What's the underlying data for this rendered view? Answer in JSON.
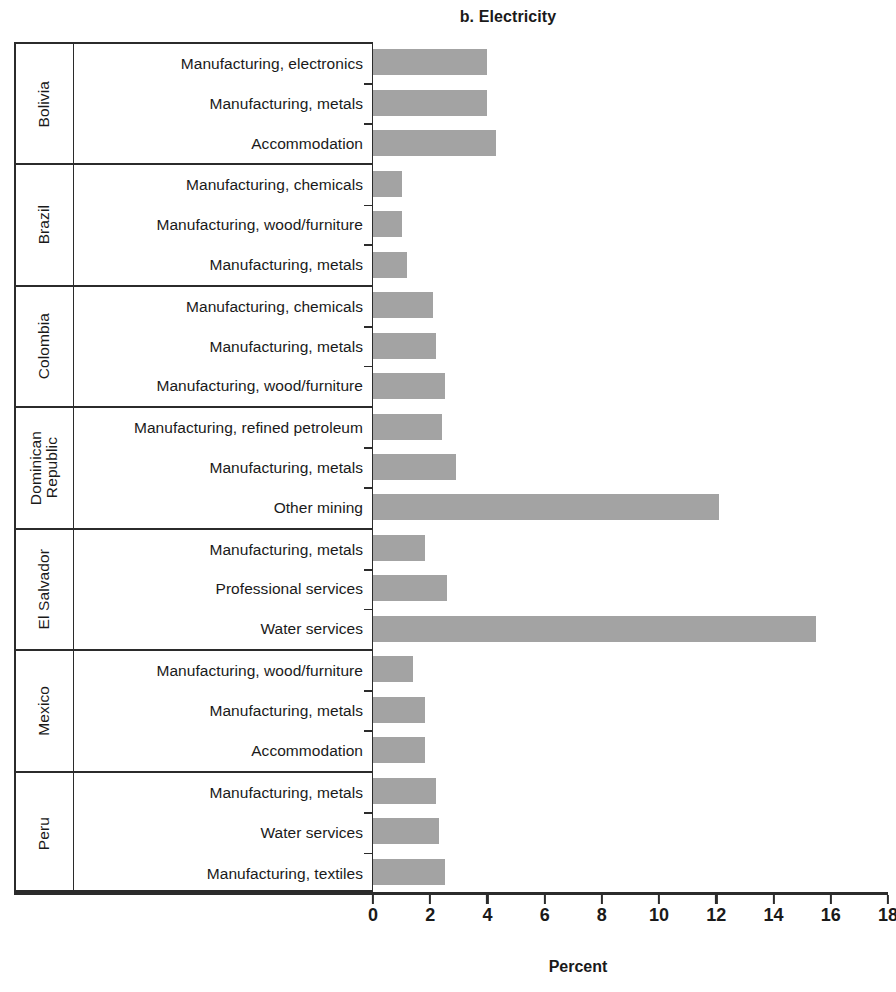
{
  "chart_data": {
    "type": "bar",
    "title": "b. Electricity",
    "xlabel": "Percent",
    "ylabel": "",
    "orientation": "horizontal",
    "xlim": [
      0,
      18
    ],
    "xticks": [
      0,
      2,
      4,
      6,
      8,
      10,
      12,
      14,
      16,
      18
    ],
    "xtick_labels": [
      "0",
      "2",
      "4",
      "6",
      "8",
      "10",
      "12",
      "14",
      "16",
      "18"
    ],
    "grid": false,
    "legend": null,
    "bar_color": "#a3a3a3",
    "groups": [
      {
        "country": "Bolivia",
        "rows": [
          {
            "label": "Manufacturing, electronics",
            "value": 4.0
          },
          {
            "label": "Manufacturing, metals",
            "value": 4.0
          },
          {
            "label": "Accommodation",
            "value": 4.3
          }
        ]
      },
      {
        "country": "Brazil",
        "rows": [
          {
            "label": "Manufacturing, chemicals",
            "value": 1.0
          },
          {
            "label": "Manufacturing, wood/furniture",
            "value": 1.0
          },
          {
            "label": "Manufacturing, metals",
            "value": 1.2
          }
        ]
      },
      {
        "country": "Colombia",
        "rows": [
          {
            "label": "Manufacturing, chemicals",
            "value": 2.1
          },
          {
            "label": "Manufacturing, metals",
            "value": 2.2
          },
          {
            "label": "Manufacturing, wood/furniture",
            "value": 2.5
          }
        ]
      },
      {
        "country": "Dominican\nRepublic",
        "rows": [
          {
            "label": "Manufacturing, refined petroleum",
            "value": 2.4
          },
          {
            "label": "Manufacturing, metals",
            "value": 2.9
          },
          {
            "label": "Other mining",
            "value": 12.1
          }
        ]
      },
      {
        "country": "El Salvador",
        "rows": [
          {
            "label": "Manufacturing, metals",
            "value": 1.8
          },
          {
            "label": "Professional services",
            "value": 2.6
          },
          {
            "label": "Water services",
            "value": 15.5
          }
        ]
      },
      {
        "country": "Mexico",
        "rows": [
          {
            "label": "Manufacturing, wood/furniture",
            "value": 1.4
          },
          {
            "label": "Manufacturing, metals",
            "value": 1.8
          },
          {
            "label": "Accommodation",
            "value": 1.8
          }
        ]
      },
      {
        "country": "Peru",
        "rows": [
          {
            "label": "Manufacturing, metals",
            "value": 2.2
          },
          {
            "label": "Water services",
            "value": 2.3
          },
          {
            "label": "Manufacturing, textiles",
            "value": 2.5
          }
        ]
      }
    ]
  }
}
